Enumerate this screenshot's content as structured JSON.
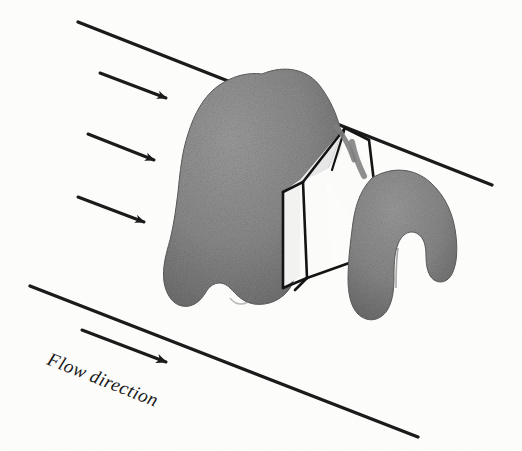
{
  "figure": {
    "background_color": "#fdfdfc",
    "width": 522,
    "height": 451
  },
  "labels": {
    "flow_direction": "Flow direction"
  },
  "colors": {
    "line_stroke": "#1b1b1b",
    "body_fill": "#8d8d8d",
    "body_fill_dark": "#6f6f6f",
    "body_fill_light": "#a3a3a3",
    "box_face": "#fbfbfa",
    "box_edge": "#141414",
    "background": "#fdfdfc",
    "text": "#1a1a1a"
  },
  "geometry": {
    "top_boundary_line": {
      "x1": 78,
      "y1": 22,
      "x2": 492,
      "y2": 185,
      "width": 3.2
    },
    "bottom_boundary_line": {
      "x1": 30,
      "y1": 286,
      "x2": 418,
      "y2": 437,
      "width": 3.2
    },
    "flow_arrows": [
      {
        "name": "flow-arrow-1",
        "x1": 100,
        "y1": 73,
        "x2": 170,
        "y2": 100
      },
      {
        "name": "flow-arrow-2",
        "x1": 88,
        "y1": 134,
        "x2": 158,
        "y2": 162
      },
      {
        "name": "flow-arrow-3",
        "x1": 78,
        "y1": 197,
        "x2": 148,
        "y2": 224
      },
      {
        "name": "flow-label-arrow",
        "x1": 82,
        "y1": 330,
        "x2": 172,
        "y2": 364
      }
    ],
    "flow_label_position": {
      "x": 48,
      "y": 364,
      "rotation_deg": 21.5
    }
  },
  "shapes": {
    "left_body": {
      "name": "upstream-lobe",
      "description": "large irregular grey lobe body"
    },
    "right_body": {
      "name": "downstream-arch",
      "description": "arch shaped grey body with two legs"
    },
    "control_volume_box": {
      "name": "control-volume-box",
      "description": "white rectangular prism outline crossing between bodies"
    }
  }
}
